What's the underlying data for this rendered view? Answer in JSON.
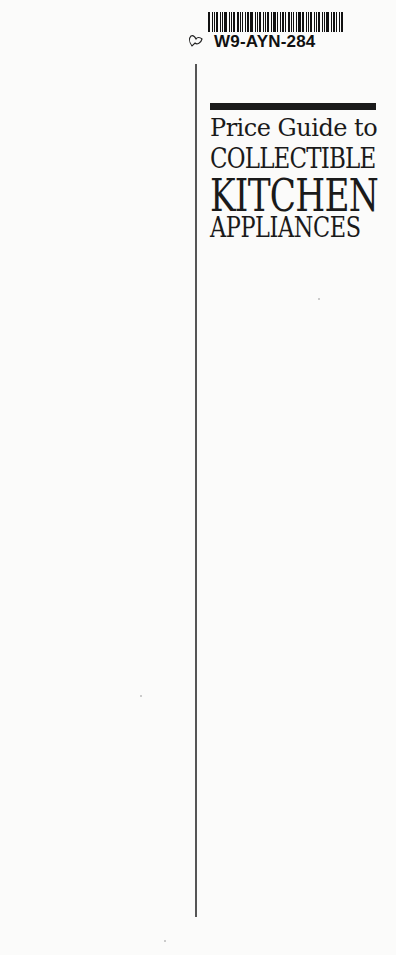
{
  "sticker": {
    "code": "W9-AYN-284",
    "icon": "heart-outline-icon"
  },
  "cover": {
    "title_line1": "Price Guide to",
    "title_line2": "COLLECTIBLE",
    "title_line3": "KITCHEN",
    "title_line4": "APPLIANCES"
  },
  "colors": {
    "background": "#fbfbfa",
    "ink": "#1a1a1a",
    "rule": "#555555"
  }
}
